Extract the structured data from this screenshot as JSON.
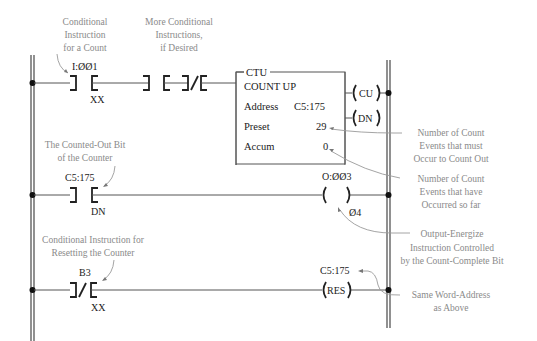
{
  "diagram": {
    "type": "ladder-logic",
    "rungs": [
      {
        "id": 1,
        "contacts": [
          {
            "type": "XIC",
            "address": "I:ØØ1",
            "bit": "XX"
          },
          {
            "type": "XIC",
            "address": "",
            "bit": ""
          },
          {
            "type": "XIO",
            "address": "",
            "bit": ""
          }
        ],
        "instruction": {
          "tag": "CTU",
          "title": "COUNT UP",
          "address_label": "Address",
          "address_value": "C5:175",
          "preset_label": "Preset",
          "preset_value": "29",
          "accum_label": "Accum",
          "accum_value": "0",
          "outputs": [
            "CU",
            "DN"
          ]
        }
      },
      {
        "id": 2,
        "contacts": [
          {
            "type": "XIC",
            "address": "C5:175",
            "bit": "DN"
          }
        ],
        "output": {
          "type": "OTE",
          "address": "O:ØØ3",
          "bit": "Ø4",
          "label": ""
        }
      },
      {
        "id": 3,
        "contacts": [
          {
            "type": "XIO",
            "address": "B3",
            "bit": "XX"
          }
        ],
        "output": {
          "type": "RES",
          "address": "C5:175",
          "label": "RES"
        }
      }
    ],
    "annotations": {
      "cond_count": [
        "Conditional",
        "Instruction",
        "for a Count"
      ],
      "more_cond": [
        "More Conditional",
        "Instructions,",
        "if Desired"
      ],
      "preset_note": [
        "Number of Count",
        "Events that must",
        "Occur to Count Out"
      ],
      "accum_note": [
        "Number of Count",
        "Events that have",
        "Occurred so far"
      ],
      "done_bit": [
        "The Counted-Out Bit",
        "of the Counter"
      ],
      "output_note": [
        "Output-Energize",
        "Instruction Controlled",
        "by the Count-Complete Bit"
      ],
      "reset_cond": [
        "Conditional Instruction for",
        "Resetting the Counter"
      ],
      "same_addr": [
        "Same Word-Address",
        "as Above"
      ]
    }
  }
}
